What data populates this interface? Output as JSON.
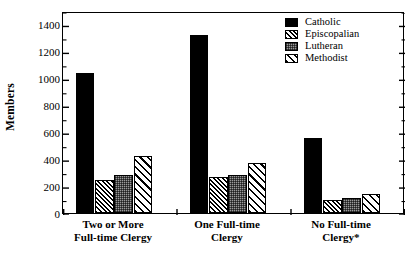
{
  "chart_data": {
    "type": "bar",
    "title": "",
    "subtitle": "",
    "xlabel": "",
    "ylabel": "Members",
    "ylim": [
      0,
      1500
    ],
    "yticks": [
      0,
      200,
      400,
      600,
      800,
      1000,
      1200,
      1400
    ],
    "ytick_labels": [
      "0",
      "200",
      "400",
      "600",
      "800",
      "1000",
      "1200",
      "1400"
    ],
    "minor_tick_interval": 100,
    "grid": false,
    "legend_position": "top-right",
    "categories": [
      "Two or More Full-time Clergy",
      "One Full-time Clergy",
      "No Full-time Clergy*"
    ],
    "category_lines": [
      [
        "Two or More",
        "Full-time Clergy"
      ],
      [
        "One Full-time",
        "Clergy"
      ],
      [
        "No Full-time",
        "Clergy*"
      ]
    ],
    "series": [
      {
        "name": "Catholic",
        "pattern": "solid-black",
        "values": [
          1040,
          1320,
          555
        ]
      },
      {
        "name": "Episcopalian",
        "pattern": "dense-diagonal-hatch",
        "values": [
          245,
          270,
          100
        ]
      },
      {
        "name": "Lutheran",
        "pattern": "gray-stipple",
        "values": [
          280,
          285,
          115
        ]
      },
      {
        "name": "Methodist",
        "pattern": "wide-diagonal-hatch",
        "values": [
          420,
          375,
          140
        ]
      }
    ],
    "annotations": [
      "*"
    ],
    "colors": {
      "axis": "#000000",
      "frame": "#000000",
      "catholic": "#000000",
      "lutheran_fill": "#9a9a9a",
      "background": "#ffffff"
    }
  },
  "legend": {
    "items": [
      {
        "label": "Catholic",
        "swatch": "solid-black-swatch"
      },
      {
        "label": "Episcopalian",
        "swatch": "dense-hatch-swatch"
      },
      {
        "label": "Lutheran",
        "swatch": "gray-stipple-swatch"
      },
      {
        "label": "Methodist",
        "swatch": "wide-hatch-swatch"
      }
    ]
  },
  "axes": {
    "y_title": "Members"
  }
}
